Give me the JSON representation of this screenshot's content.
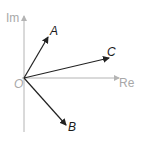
{
  "diagram": {
    "type": "argand-diagram",
    "axes": {
      "real_label": "Re",
      "imaginary_label": "Im",
      "origin_label": "O",
      "color": "#b4b4b4"
    },
    "vectors": [
      {
        "name": "A",
        "label": "A",
        "from": "O",
        "direction": "up-right (steep)"
      },
      {
        "name": "B",
        "label": "B",
        "from": "O",
        "direction": "down-right"
      },
      {
        "name": "C",
        "label": "C",
        "from": "O",
        "direction": "right (shallow up)"
      }
    ],
    "vector_color": "#222222"
  }
}
